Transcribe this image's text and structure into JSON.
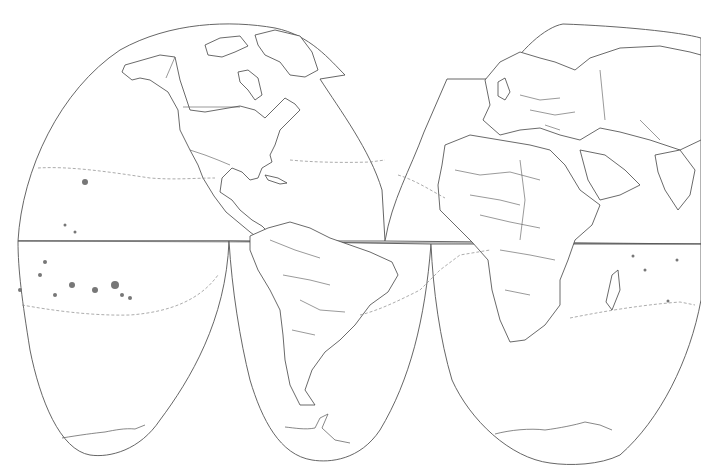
{
  "map": {
    "title": "",
    "projection": "interrupted goode homolosine",
    "style": "blank outline map",
    "regions": [
      "North America",
      "South America",
      "Europe",
      "Africa",
      "Asia",
      "Pacific Ocean",
      "Atlantic Ocean",
      "Indian Ocean",
      "Antarctica"
    ],
    "colors": {
      "background": "#ffffff",
      "outline": "#555555",
      "coastline": "#444444",
      "dashed_line": "#888888",
      "islands": "#777777"
    }
  }
}
